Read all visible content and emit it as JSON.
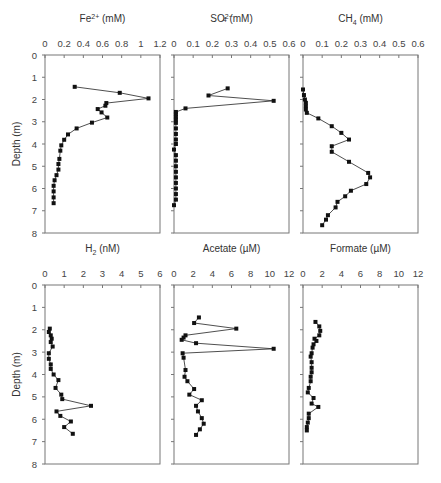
{
  "figure": {
    "ylabel": "Depth (m)",
    "depth_ticks": [
      "0",
      "1",
      "2",
      "3",
      "4",
      "5",
      "6",
      "7",
      "8"
    ]
  },
  "chart_data": [
    {
      "type": "line",
      "title": "Fe2+ (mM)",
      "title_main": "Fe",
      "title_sup": "2+",
      "title_unit": " (mM)",
      "xlabel": "Fe2+ (mM)",
      "ylabel": "Depth (m)",
      "xlim": [
        0,
        1.2
      ],
      "ylim": [
        0,
        8
      ],
      "xticks": [
        "0",
        "0.2",
        "0.4",
        "0.6",
        "0.8",
        "1",
        "1.2"
      ],
      "points": [
        [
          0.31,
          1.43
        ],
        [
          0.78,
          1.7
        ],
        [
          1.08,
          1.95
        ],
        [
          0.64,
          2.16
        ],
        [
          0.63,
          2.28
        ],
        [
          0.55,
          2.43
        ],
        [
          0.59,
          2.58
        ],
        [
          0.65,
          2.81
        ],
        [
          0.49,
          3.04
        ],
        [
          0.33,
          3.3
        ],
        [
          0.24,
          3.57
        ],
        [
          0.2,
          3.81
        ],
        [
          0.17,
          4.06
        ],
        [
          0.16,
          4.3
        ],
        [
          0.15,
          4.67
        ],
        [
          0.14,
          4.9
        ],
        [
          0.14,
          5.15
        ],
        [
          0.12,
          5.4
        ],
        [
          0.1,
          5.63
        ],
        [
          0.09,
          5.88
        ],
        [
          0.09,
          6.13
        ],
        [
          0.09,
          6.4
        ],
        [
          0.09,
          6.66
        ]
      ]
    },
    {
      "type": "line",
      "title": "SO4 2- (mM)",
      "title_main": "SO",
      "title_sub": "4",
      "title_sup": "2−",
      "title_unit": " (mM)",
      "xlabel": "SO4 2- (mM)",
      "ylabel": "Depth (m)",
      "xlim": [
        0,
        0.6
      ],
      "ylim": [
        0,
        8
      ],
      "xticks": [
        "0",
        "0.1",
        "0.2",
        "0.3",
        "0.4",
        "0.5",
        "0.6"
      ],
      "points": [
        [
          0.28,
          1.5
        ],
        [
          0.18,
          1.82
        ],
        [
          0.52,
          2.06
        ],
        [
          0.06,
          2.4
        ],
        [
          0.01,
          2.56
        ],
        [
          0.01,
          2.66
        ],
        [
          0.01,
          2.78
        ],
        [
          0.01,
          2.9
        ],
        [
          0.01,
          3.05
        ],
        [
          0.01,
          3.3
        ],
        [
          0.01,
          3.55
        ],
        [
          0.01,
          3.8
        ],
        [
          0.01,
          4.0
        ],
        [
          0.0,
          4.25
        ],
        [
          0.01,
          4.5
        ],
        [
          0.01,
          4.75
        ],
        [
          0.01,
          5.0
        ],
        [
          0.01,
          5.25
        ],
        [
          0.01,
          5.5
        ],
        [
          0.01,
          5.75
        ],
        [
          0.01,
          6.0
        ],
        [
          0.01,
          6.25
        ],
        [
          0.01,
          6.5
        ],
        [
          0.0,
          6.75
        ]
      ]
    },
    {
      "type": "line",
      "title": "CH4 (mM)",
      "title_main": "CH",
      "title_sub": "4",
      "title_unit": " (mM)",
      "xlabel": "CH4 (mM)",
      "ylabel": "Depth (m)",
      "xlim": [
        0,
        0.6
      ],
      "ylim": [
        0,
        8
      ],
      "xticks": [
        "0",
        "0.1",
        "0.2",
        "0.3",
        "0.4",
        "0.5",
        "0.6"
      ],
      "points": [
        [
          0.0,
          1.55
        ],
        [
          0.005,
          1.8
        ],
        [
          0.01,
          2.0
        ],
        [
          0.015,
          2.15
        ],
        [
          0.015,
          2.3
        ],
        [
          0.015,
          2.45
        ],
        [
          0.02,
          2.6
        ],
        [
          0.08,
          2.85
        ],
        [
          0.15,
          3.2
        ],
        [
          0.2,
          3.5
        ],
        [
          0.24,
          3.8
        ],
        [
          0.15,
          4.1
        ],
        [
          0.15,
          4.35
        ],
        [
          0.24,
          4.8
        ],
        [
          0.34,
          5.3
        ],
        [
          0.35,
          5.5
        ],
        [
          0.33,
          5.8
        ],
        [
          0.25,
          6.1
        ],
        [
          0.22,
          6.35
        ],
        [
          0.18,
          6.6
        ],
        [
          0.17,
          6.85
        ],
        [
          0.13,
          7.2
        ],
        [
          0.12,
          7.4
        ],
        [
          0.1,
          7.65
        ]
      ]
    },
    {
      "type": "line",
      "title": "H2 (nM)",
      "title_main": "H",
      "title_sub": "2",
      "title_unit": " (nM)",
      "xlabel": "H2 (nM)",
      "ylabel": "Depth (m)",
      "xlim": [
        0,
        6
      ],
      "ylim": [
        0,
        8
      ],
      "xticks": [
        "0",
        "1",
        "2",
        "3",
        "4",
        "5",
        "6"
      ],
      "points": [
        [
          0.25,
          1.95
        ],
        [
          0.2,
          2.1
        ],
        [
          0.3,
          2.25
        ],
        [
          0.35,
          2.4
        ],
        [
          0.3,
          2.55
        ],
        [
          0.4,
          2.75
        ],
        [
          0.2,
          3.05
        ],
        [
          0.2,
          3.3
        ],
        [
          0.3,
          3.55
        ],
        [
          0.3,
          3.75
        ],
        [
          0.45,
          4.0
        ],
        [
          0.7,
          4.25
        ],
        [
          0.55,
          4.6
        ],
        [
          0.85,
          4.9
        ],
        [
          0.9,
          5.1
        ],
        [
          2.4,
          5.4
        ],
        [
          0.6,
          5.65
        ],
        [
          0.8,
          5.85
        ],
        [
          1.35,
          6.1
        ],
        [
          1.0,
          6.35
        ],
        [
          1.45,
          6.65
        ]
      ]
    },
    {
      "type": "line",
      "title": "Acetate (µM)",
      "title_main": "Acetate",
      "title_unit": " (µM)",
      "xlabel": "Acetate (µM)",
      "ylabel": "Depth (m)",
      "xlim": [
        0,
        12
      ],
      "ylim": [
        0,
        8
      ],
      "xticks": [
        "0",
        "2",
        "4",
        "6",
        "8",
        "10",
        "12"
      ],
      "points": [
        [
          2.6,
          1.45
        ],
        [
          2.1,
          1.7
        ],
        [
          6.5,
          1.95
        ],
        [
          1.2,
          2.25
        ],
        [
          1.0,
          2.35
        ],
        [
          0.8,
          2.45
        ],
        [
          2.3,
          2.6
        ],
        [
          10.4,
          2.85
        ],
        [
          0.9,
          3.05
        ],
        [
          1.0,
          3.25
        ],
        [
          1.2,
          3.8
        ],
        [
          1.1,
          4.1
        ],
        [
          1.4,
          4.3
        ],
        [
          2.1,
          4.65
        ],
        [
          1.6,
          4.9
        ],
        [
          2.9,
          5.15
        ],
        [
          2.3,
          5.4
        ],
        [
          2.5,
          5.65
        ],
        [
          2.9,
          5.95
        ],
        [
          3.1,
          6.2
        ],
        [
          2.7,
          6.45
        ],
        [
          2.3,
          6.7
        ]
      ]
    },
    {
      "type": "line",
      "title": "Formate (µM)",
      "title_main": "Formate",
      "title_unit": " (µM)",
      "xlabel": "Formate (µM)",
      "ylabel": "Depth (m)",
      "xlim": [
        0,
        12
      ],
      "ylim": [
        0,
        8
      ],
      "xticks": [
        "0",
        "2",
        "4",
        "6",
        "8",
        "10",
        "12"
      ],
      "points": [
        [
          1.3,
          1.65
        ],
        [
          1.7,
          1.85
        ],
        [
          1.8,
          2.05
        ],
        [
          1.7,
          2.25
        ],
        [
          1.2,
          2.4
        ],
        [
          1.4,
          2.5
        ],
        [
          1.1,
          2.65
        ],
        [
          1.0,
          2.8
        ],
        [
          0.9,
          3.05
        ],
        [
          0.8,
          3.2
        ],
        [
          0.9,
          3.45
        ],
        [
          0.9,
          3.7
        ],
        [
          0.9,
          3.9
        ],
        [
          0.8,
          4.1
        ],
        [
          0.8,
          4.3
        ],
        [
          0.6,
          4.6
        ],
        [
          0.5,
          4.8
        ],
        [
          1.1,
          5.05
        ],
        [
          0.9,
          5.3
        ],
        [
          1.6,
          5.45
        ],
        [
          0.6,
          5.75
        ],
        [
          0.6,
          5.95
        ],
        [
          0.5,
          6.15
        ],
        [
          0.4,
          6.35
        ],
        [
          0.4,
          6.5
        ]
      ]
    }
  ]
}
